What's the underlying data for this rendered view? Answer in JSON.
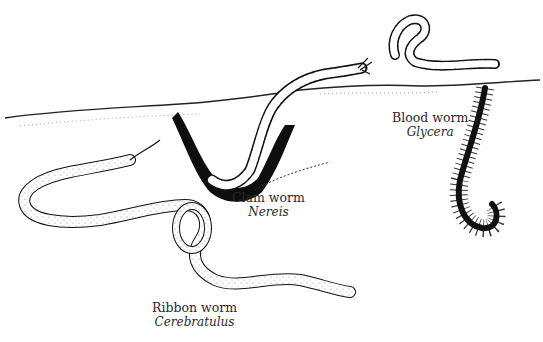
{
  "figure": {
    "colors": {
      "ink": "#111111",
      "paper": "#ffffff",
      "text": "#2a2a2a"
    },
    "labels": [
      {
        "id": "clam",
        "common": "Clam worm",
        "genus": "Nereis"
      },
      {
        "id": "blood",
        "common": "Blood worm",
        "genus": "Glycera"
      },
      {
        "id": "ribbon",
        "common": "Ribbon worm",
        "genus": "Cerebratulus"
      }
    ]
  }
}
